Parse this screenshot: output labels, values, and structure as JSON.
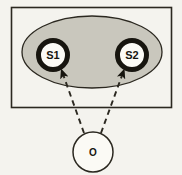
{
  "figure": {
    "background_color": "#f4f3ee",
    "outline_color": "#17150f"
  },
  "container": {
    "name": "state-space-rectangle",
    "shape": "rectangle",
    "fill_color": "#f4f3ee",
    "stroke_color": "#2b2820",
    "x": 11,
    "y": 7,
    "width": 161,
    "height": 101
  },
  "region": {
    "name": "belief-region-ellipse",
    "shape": "ellipse",
    "fill_color": "#c9c7bd",
    "stroke_color": "#2b2820",
    "cx": 92,
    "cy": 52,
    "rx": 70,
    "ry": 36
  },
  "nodes": [
    {
      "id": "s1",
      "label": "S1",
      "shape": "circle",
      "cx": 53,
      "cy": 55,
      "outer_r": 17,
      "inner_r": 12,
      "ring_color": "#17150f",
      "fill_color": "#fbfaf5"
    },
    {
      "id": "s2",
      "label": "S2",
      "shape": "circle",
      "cx": 132,
      "cy": 55,
      "outer_r": 17,
      "inner_r": 12,
      "ring_color": "#17150f",
      "fill_color": "#fbfaf5"
    },
    {
      "id": "o",
      "label": "O",
      "shape": "circle",
      "cx": 93,
      "cy": 152,
      "outer_r": 20,
      "inner_r": 20,
      "ring_color": "#2b2820",
      "fill_color": "#fbfaf5"
    }
  ],
  "edges": [
    {
      "id": "o-to-s1",
      "from": "o",
      "to": "s1",
      "style": "dashed",
      "arrowhead": "filled-triangle",
      "color": "#2b2820"
    },
    {
      "id": "o-to-s2",
      "from": "o",
      "to": "s2",
      "style": "dashed",
      "arrowhead": "filled-triangle",
      "color": "#2b2820"
    }
  ]
}
